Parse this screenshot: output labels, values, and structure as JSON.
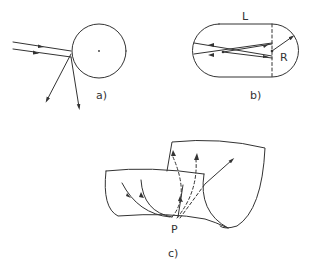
{
  "figure": {
    "panels": [
      {
        "id": "a",
        "label": "a)",
        "description": "Two parallel rays striking a circle tangentially and scattering downward",
        "elements": [
          "circle",
          "center-dot",
          "incoming-ray-1",
          "incoming-ray-2",
          "scattered-ray-1",
          "scattered-ray-2"
        ]
      },
      {
        "id": "b",
        "label": "b)",
        "length_label": "L",
        "radius_label": "R",
        "description": "Stadium billiard with straight length L and semicircle radius R, rays bouncing inside"
      },
      {
        "id": "c",
        "label": "c)",
        "point_label": "P",
        "description": "Two curved sheets meeting along a fold line, with solid and dashed trajectories converging at point P"
      }
    ]
  },
  "colors": {
    "ink": "#333333",
    "background": "#ffffff"
  }
}
